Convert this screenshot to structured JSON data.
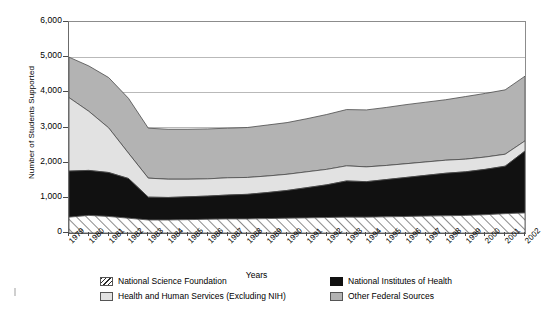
{
  "axes": {
    "ylabel": "Number of Students Supported",
    "xlabel": "Years",
    "yticks": [
      "0",
      "1,000",
      "2,000",
      "3,000",
      "4,000",
      "5,000",
      "6,000"
    ]
  },
  "legend": {
    "items": [
      {
        "label": "National Science Foundation",
        "swatch": "hatch-swatch",
        "color": "#ffffff"
      },
      {
        "label": "National Institutes of Health",
        "swatch": "black-swatch",
        "color": "#111111"
      },
      {
        "label": "Health and Human Services (Excluding NIH)",
        "swatch": "light-gray-swatch",
        "color": "#e2e2e2"
      },
      {
        "label": "Other Federal Sources",
        "swatch": "medium-gray-swatch",
        "color": "#b3b3b3"
      }
    ]
  },
  "chart_data": {
    "type": "area",
    "stacked": true,
    "title": "",
    "xlabel": "Years",
    "ylabel": "Number of Students Supported",
    "ylim": [
      0,
      6000
    ],
    "ytick_step": 1000,
    "grid": true,
    "legend_position": "bottom",
    "categories": [
      "1979",
      "1980",
      "1981",
      "1982",
      "1983",
      "1984",
      "1985",
      "1986",
      "1987",
      "1988",
      "1989",
      "1990",
      "1991",
      "1992",
      "1993",
      "1994",
      "1995",
      "1996",
      "1997",
      "1998",
      "1999",
      "2000",
      "2001",
      "2002"
    ],
    "series": [
      {
        "name": "National Science Foundation",
        "color": "#ffffff",
        "pattern": "diagonal-hatch",
        "values": [
          450,
          500,
          470,
          420,
          370,
          370,
          380,
          390,
          400,
          400,
          410,
          420,
          430,
          440,
          450,
          450,
          460,
          470,
          480,
          490,
          500,
          520,
          550,
          570
        ]
      },
      {
        "name": "National Institutes of Health",
        "color": "#111111",
        "pattern": "solid",
        "values": [
          1310,
          1280,
          1250,
          1130,
          650,
          640,
          650,
          660,
          680,
          700,
          740,
          790,
          860,
          930,
          1030,
          1010,
          1060,
          1110,
          1160,
          1210,
          1240,
          1290,
          1350,
          1760
        ]
      },
      {
        "name": "Health and Human Services (Excluding NIH)",
        "color": "#e2e2e2",
        "pattern": "solid",
        "values": [
          2090,
          1680,
          1270,
          720,
          540,
          520,
          500,
          490,
          490,
          480,
          470,
          460,
          450,
          440,
          430,
          420,
          400,
          390,
          380,
          370,
          360,
          350,
          340,
          290
        ]
      },
      {
        "name": "Other Federal Sources",
        "color": "#b3b3b3",
        "pattern": "solid",
        "values": [
          1150,
          1290,
          1430,
          1560,
          1420,
          1420,
          1420,
          1420,
          1410,
          1420,
          1450,
          1470,
          1510,
          1560,
          1600,
          1620,
          1650,
          1680,
          1700,
          1720,
          1780,
          1810,
          1830,
          1840
        ]
      }
    ],
    "stack_totals": [
      5000,
      4750,
      4420,
      3830,
      2980,
      2950,
      2950,
      2960,
      2980,
      3000,
      3070,
      3140,
      3250,
      3370,
      3510,
      3500,
      3570,
      3650,
      3720,
      3790,
      3880,
      3970,
      4070,
      4460
    ]
  }
}
